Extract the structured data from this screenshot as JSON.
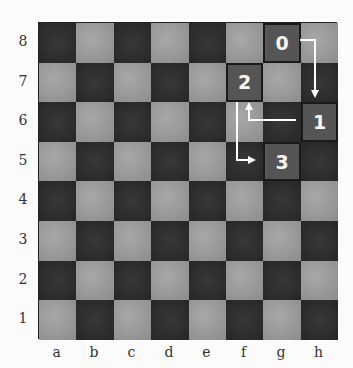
{
  "board": {
    "files": [
      "a",
      "b",
      "c",
      "d",
      "e",
      "f",
      "g",
      "h"
    ],
    "ranks": [
      "8",
      "7",
      "6",
      "5",
      "4",
      "3",
      "2",
      "1"
    ],
    "colors": {
      "light": "#9a9a9a",
      "dark": "#2f2f2f",
      "marked": "#555555",
      "arrow": "#ffffff"
    }
  },
  "path": [
    {
      "step": "0",
      "square": "g8"
    },
    {
      "step": "1",
      "square": "h6"
    },
    {
      "step": "2",
      "square": "f7"
    },
    {
      "step": "3",
      "square": "g5"
    }
  ]
}
